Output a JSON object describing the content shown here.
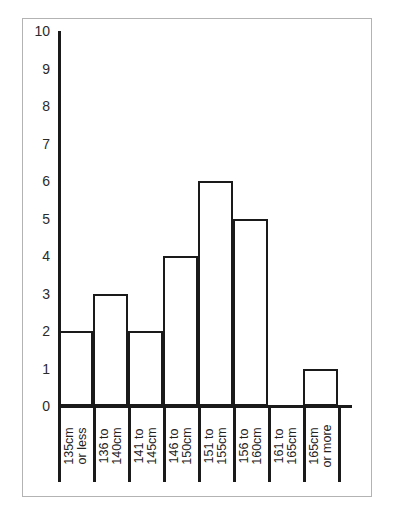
{
  "chart_data": {
    "type": "bar",
    "title": "",
    "subtitle": "",
    "xlabel": "",
    "ylabel": "",
    "categories": [
      "135cm or less",
      "136 to 140cm",
      "141 to 145cm",
      "146 to 150cm",
      "151 to 155cm",
      "156 to 160cm",
      "161 to 165cm",
      "165cm or more"
    ],
    "category_lines": [
      [
        "135cm",
        "or less"
      ],
      [
        "136 to",
        "140cm"
      ],
      [
        "141 to",
        "145cm"
      ],
      [
        "146 to",
        "150cm"
      ],
      [
        "151 to",
        "155cm"
      ],
      [
        "156 to",
        "160cm"
      ],
      [
        "161 to",
        "165cm"
      ],
      [
        "165cm",
        "or more"
      ]
    ],
    "values": [
      2,
      3,
      2,
      4,
      6,
      5,
      0,
      1
    ],
    "ylim": [
      0,
      10
    ],
    "yticks": [
      0,
      1,
      2,
      3,
      4,
      5,
      6,
      7,
      8,
      9,
      10
    ],
    "ytick_labels": [
      "0",
      "1",
      "2",
      "3",
      "4",
      "5",
      "6",
      "7",
      "8",
      "9",
      "10"
    ],
    "grid": false,
    "legend": null,
    "legend_position": "none",
    "bar_style": "outline",
    "bar_gap": 0,
    "xtick_label_rotation": 90,
    "annotations": []
  },
  "style": {
    "ink_color": "#1a1a1a",
    "frame_color": "#b3b3b3",
    "background_color": "#ffffff",
    "tick_label_color": "#2b2b2b"
  }
}
